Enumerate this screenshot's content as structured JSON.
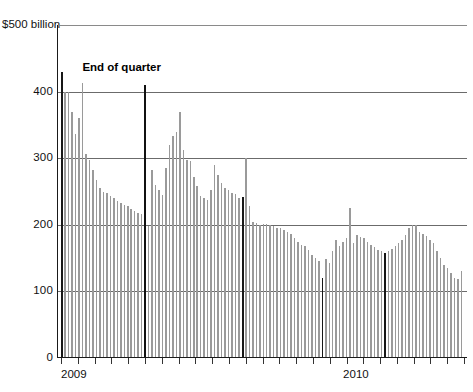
{
  "chart_data": {
    "type": "bar",
    "title": "",
    "subtitle": "",
    "xlabel": "",
    "ylabel": "",
    "unit_label": "$500 billion",
    "ylim": [
      0,
      500
    ],
    "ytick_values": [
      400,
      300,
      200,
      100,
      0
    ],
    "ytick_labels": [
      "400",
      "300",
      "200",
      "100",
      "0"
    ],
    "grid": true,
    "grid_axis": "y",
    "legend": null,
    "xtick_labels": [
      "2009",
      "2010"
    ],
    "annotations": [
      {
        "text": "End of quarter",
        "value_note": "marks the dark quarter-end bars"
      }
    ],
    "series": [
      {
        "name": "Daily balance",
        "values": [
          430,
          400,
          400,
          370,
          337,
          360,
          413,
          307,
          297,
          283,
          268,
          255,
          250,
          248,
          244,
          240,
          236,
          233,
          230,
          228,
          224,
          221,
          218,
          216,
          410,
          198,
          283,
          260,
          252,
          245,
          285,
          320,
          333,
          340,
          370,
          312,
          297,
          296,
          272,
          258,
          243,
          240,
          238,
          252,
          290,
          275,
          263,
          255,
          252,
          248,
          247,
          240,
          242,
          300,
          228,
          205,
          203,
          200,
          202,
          201,
          200,
          198,
          196,
          195,
          193,
          190,
          186,
          180,
          175,
          170,
          168,
          162,
          155,
          150,
          145,
          120,
          148,
          142,
          160,
          178,
          168,
          175,
          180,
          225,
          172,
          185,
          182,
          180,
          175,
          170,
          166,
          162,
          160,
          158,
          160,
          163,
          168,
          172,
          178,
          185,
          196,
          200,
          200,
          190,
          186,
          183,
          178,
          172,
          160,
          150,
          140,
          135,
          128,
          120,
          118,
          130
        ],
        "quarter_end_indices": [
          0,
          24,
          52,
          75,
          93,
          120
        ],
        "color_regular": "#9a9a9a",
        "color_quarter_end": "#171717"
      }
    ]
  },
  "axes": {
    "unit_top": "$500 billion",
    "y": [
      "400",
      "300",
      "200",
      "100",
      "0"
    ],
    "x": [
      "2009",
      "2010"
    ]
  },
  "annotation": {
    "end_of_quarter": "End of quarter"
  }
}
